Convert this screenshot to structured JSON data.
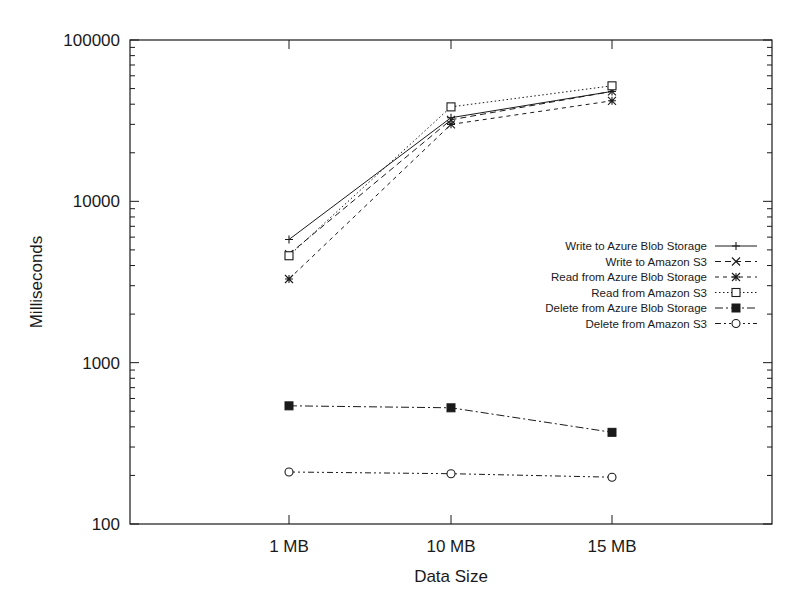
{
  "chart_data": {
    "type": "line",
    "title": "",
    "xlabel": "Data Size",
    "ylabel": "Milliseconds",
    "yscale": "log",
    "ylim": [
      100,
      100000
    ],
    "yticks": [
      100,
      1000,
      10000,
      100000
    ],
    "ytick_labels": [
      "100",
      "1000",
      "10000",
      "100000"
    ],
    "categories": [
      "1 MB",
      "10 MB",
      "15 MB"
    ],
    "grid": false,
    "legend_position": "right-center inside plot",
    "series": [
      {
        "name": "Write to Azure Blob Storage",
        "marker": "plus",
        "dash": "solid",
        "values": [
          5800,
          33000,
          48000
        ]
      },
      {
        "name": "Write to Amazon S3",
        "marker": "cross",
        "dash": "dashed",
        "values": [
          4700,
          32000,
          48000
        ]
      },
      {
        "name": "Read from Azure Blob Storage",
        "marker": "asterisk",
        "dash": "short-dashed",
        "values": [
          3300,
          30000,
          42000
        ]
      },
      {
        "name": "Read from Amazon S3",
        "marker": "open-square",
        "dash": "dotted",
        "values": [
          4600,
          38500,
          52000
        ]
      },
      {
        "name": "Delete from Azure Blob Storage",
        "marker": "filled-square",
        "dash": "dash-dot",
        "values": [
          540,
          525,
          370
        ]
      },
      {
        "name": "Delete from Amazon S3",
        "marker": "open-circle",
        "dash": "dash-dot-dot",
        "values": [
          210,
          205,
          195
        ]
      }
    ]
  },
  "colors": {
    "ink": "#1a1a1a",
    "background": "#ffffff"
  }
}
